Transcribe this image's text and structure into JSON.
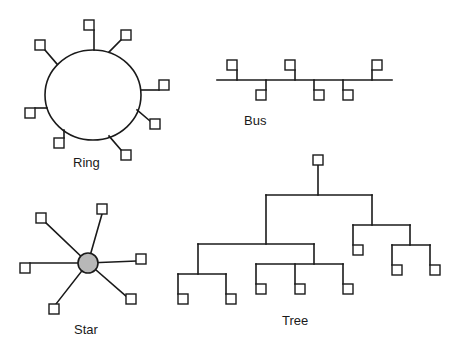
{
  "colors": {
    "line": "#1a1a1a",
    "node_fill": "#ffffff",
    "hub_fill": "#b8b8b8",
    "background": "#ffffff"
  },
  "diagrams": {
    "ring": {
      "label": "Ring",
      "label_pos": [
        73,
        167
      ],
      "circle": {
        "cx": 93,
        "cy": 95,
        "rx": 48,
        "ry": 45
      },
      "nodes": [
        {
          "box": [
            84,
            20
          ],
          "stem": [
            94,
            30,
            94,
            50
          ]
        },
        {
          "box": [
            121,
            30
          ],
          "stem": [
            121,
            40,
            109,
            52
          ]
        },
        {
          "box": [
            35,
            40
          ],
          "stem": [
            45,
            50,
            57,
            64
          ]
        },
        {
          "box": [
            159,
            80
          ],
          "stem": [
            141,
            90,
            159,
            90
          ]
        },
        {
          "box": [
            25,
            108
          ],
          "stem": [
            35,
            108,
            47,
            108
          ]
        },
        {
          "box": [
            150,
            119
          ],
          "stem": [
            150,
            121,
            137,
            110
          ]
        },
        {
          "box": [
            54,
            138
          ],
          "stem": [
            64,
            138,
            64,
            130
          ]
        },
        {
          "box": [
            121,
            150
          ],
          "stem": [
            121,
            150,
            109,
            136
          ]
        }
      ]
    },
    "bus": {
      "label": "Bus",
      "label_pos": [
        244,
        125
      ],
      "line": [
        217,
        80,
        392,
        80
      ],
      "nodes": [
        {
          "box": [
            227,
            60
          ],
          "stem": [
            237,
            70,
            237,
            80
          ]
        },
        {
          "box": [
            256,
            90
          ],
          "stem": [
            266,
            80,
            266,
            90
          ]
        },
        {
          "box": [
            285,
            60
          ],
          "stem": [
            295,
            70,
            295,
            80
          ]
        },
        {
          "box": [
            314,
            90
          ],
          "stem": [
            314,
            80,
            314,
            90
          ]
        },
        {
          "box": [
            343,
            90
          ],
          "stem": [
            343,
            80,
            343,
            90
          ]
        },
        {
          "box": [
            372,
            60
          ],
          "stem": [
            372,
            70,
            372,
            80
          ]
        }
      ]
    },
    "star": {
      "label": "Star",
      "label_pos": [
        74,
        334
      ],
      "hub": {
        "cx": 88,
        "cy": 263,
        "r": 10
      },
      "nodes": [
        {
          "box": [
            36,
            213
          ],
          "spoke": [
            46,
            223
          ]
        },
        {
          "box": [
            97,
            204
          ],
          "spoke": [
            102,
            214
          ]
        },
        {
          "box": [
            136,
            254
          ],
          "spoke": [
            136,
            261
          ]
        },
        {
          "box": [
            126,
            294
          ],
          "spoke": [
            126,
            296
          ]
        },
        {
          "box": [
            49,
            304
          ],
          "spoke": [
            56,
            304
          ]
        },
        {
          "box": [
            20,
            263
          ],
          "spoke": [
            30,
            263
          ]
        }
      ]
    },
    "tree": {
      "label": "Tree",
      "label_pos": [
        282,
        325
      ],
      "segments": [
        [
          318,
          165,
          318,
          195
        ],
        [
          266,
          195,
          372,
          195
        ],
        [
          266,
          195,
          266,
          244
        ],
        [
          198,
          244,
          314,
          244
        ],
        [
          198,
          244,
          198,
          274
        ],
        [
          178,
          274,
          226,
          274
        ],
        [
          178,
          274,
          178,
          294
        ],
        [
          226,
          274,
          226,
          294
        ],
        [
          314,
          244,
          314,
          264
        ],
        [
          256,
          264,
          343,
          264
        ],
        [
          256,
          264,
          256,
          284
        ],
        [
          295,
          264,
          295,
          284
        ],
        [
          343,
          264,
          343,
          284
        ],
        [
          372,
          195,
          372,
          225
        ],
        [
          353,
          225,
          410,
          225
        ],
        [
          353,
          225,
          353,
          245
        ],
        [
          410,
          225,
          410,
          245
        ],
        [
          392,
          245,
          430,
          245
        ],
        [
          392,
          245,
          392,
          265
        ],
        [
          430,
          245,
          430,
          265
        ]
      ],
      "nodes": [
        {
          "box": [
            313,
            155
          ]
        },
        {
          "box": [
            178,
            294
          ]
        },
        {
          "box": [
            226,
            294
          ]
        },
        {
          "box": [
            256,
            284
          ]
        },
        {
          "box": [
            295,
            284
          ]
        },
        {
          "box": [
            343,
            284
          ]
        },
        {
          "box": [
            353,
            245
          ]
        },
        {
          "box": [
            392,
            265
          ]
        },
        {
          "box": [
            430,
            265
          ]
        }
      ]
    }
  }
}
